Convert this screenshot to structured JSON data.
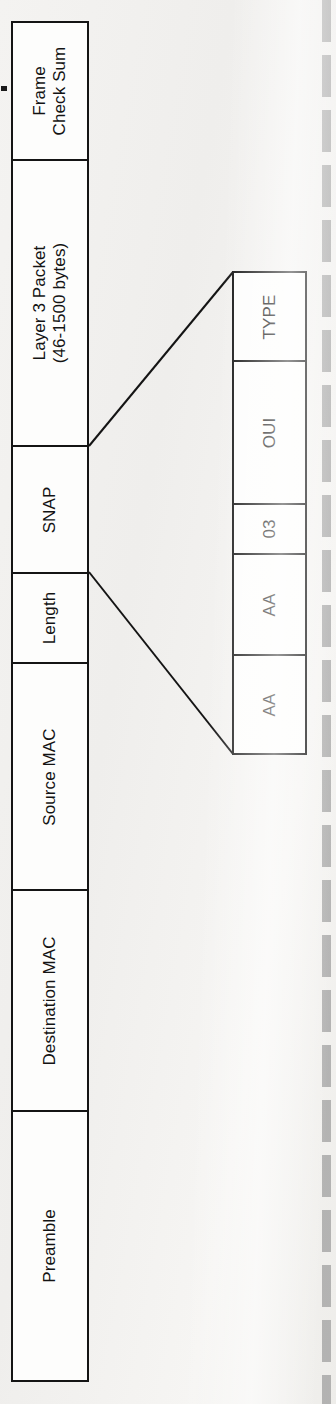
{
  "figure": {
    "background_color": "#f2f1ef",
    "line_color": "#141414",
    "box_fill": "#fdfdfc",
    "orientation": "rotated-90-ccw"
  },
  "frame_fields": [
    {
      "id": "fcs",
      "label": "Frame\nCheck Sum",
      "line1": "Frame",
      "line2": "Check Sum"
    },
    {
      "id": "layer3",
      "label": "Layer 3 Packet\n(46-1500 bytes)",
      "line1": "Layer 3 Packet",
      "line2": "(46-1500 bytes)"
    },
    {
      "id": "snap",
      "label": "SNAP",
      "line1": "SNAP",
      "line2": ""
    },
    {
      "id": "length",
      "label": "Length",
      "line1": "Length",
      "line2": ""
    },
    {
      "id": "source-mac",
      "label": "Source MAC",
      "line1": "Source MAC",
      "line2": ""
    },
    {
      "id": "dest-mac",
      "label": "Destination MAC",
      "line1": "Destination MAC",
      "line2": ""
    },
    {
      "id": "preamble",
      "label": "Preamble",
      "line1": "Preamble",
      "line2": ""
    }
  ],
  "snap_detail_fields": [
    {
      "id": "type",
      "label": "TYPE"
    },
    {
      "id": "oui",
      "label": "OUI"
    },
    {
      "id": "dsap-ssap-control",
      "label": "03"
    },
    {
      "id": "aa-2",
      "label": "AA"
    },
    {
      "id": "aa-1",
      "label": "AA"
    }
  ]
}
